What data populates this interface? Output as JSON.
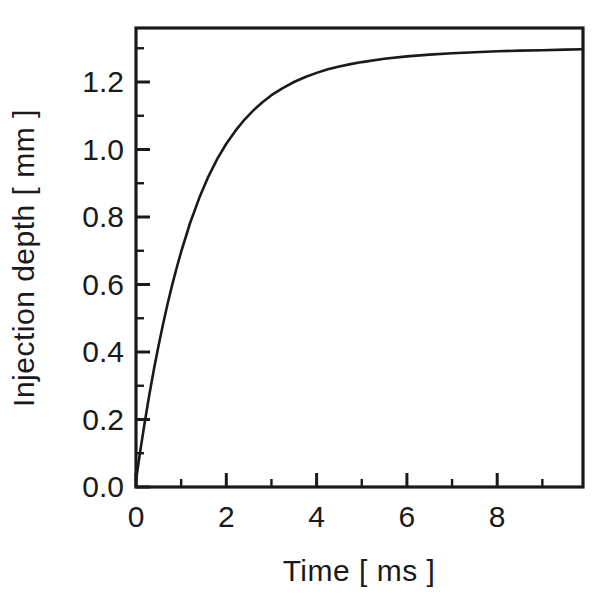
{
  "chart_data": {
    "type": "line",
    "title": "",
    "xlabel": "Time  [ ms ]",
    "ylabel": "Injection depth  [ mm ]",
    "xlim": [
      0,
      9.9
    ],
    "ylim": [
      0.0,
      1.36
    ],
    "grid": false,
    "legend": null,
    "x_ticks_major": [
      0,
      2,
      4,
      6,
      8
    ],
    "x_tick_labels": [
      "0",
      "2",
      "4",
      "6",
      "8"
    ],
    "x_ticks_minor": [
      1,
      3,
      5,
      7,
      9
    ],
    "y_ticks_major": [
      0.0,
      0.2,
      0.4,
      0.6,
      0.8,
      1.0,
      1.2
    ],
    "y_tick_labels": [
      "0.0",
      "0.2",
      "0.4",
      "0.6",
      "0.8",
      "1.0",
      "1.2"
    ],
    "y_ticks_minor": [
      0.1,
      0.3,
      0.5,
      0.7,
      0.9,
      1.1,
      1.3
    ],
    "series": [
      {
        "name": "Injection depth",
        "color": "#1a1a1a",
        "x": [
          0.0,
          0.1,
          0.2,
          0.3,
          0.4,
          0.5,
          0.6,
          0.7,
          0.8,
          0.9,
          1.0,
          1.2,
          1.4,
          1.6,
          1.8,
          2.0,
          2.2,
          2.4,
          2.6,
          2.8,
          3.0,
          3.25,
          3.5,
          3.75,
          4.0,
          4.25,
          4.5,
          4.75,
          5.0,
          5.5,
          6.0,
          6.5,
          7.0,
          7.5,
          8.0,
          8.5,
          9.0,
          9.5,
          9.9
        ],
        "y": [
          0.02,
          0.112,
          0.197,
          0.277,
          0.351,
          0.419,
          0.483,
          0.543,
          0.598,
          0.649,
          0.697,
          0.783,
          0.856,
          0.919,
          0.972,
          1.017,
          1.055,
          1.088,
          1.116,
          1.14,
          1.161,
          1.182,
          1.2,
          1.215,
          1.227,
          1.238,
          1.246,
          1.253,
          1.259,
          1.269,
          1.276,
          1.281,
          1.285,
          1.288,
          1.291,
          1.293,
          1.294,
          1.296,
          1.297
        ]
      }
    ],
    "model_note": "saturating exponential approaching ~1.30 mm"
  },
  "figure": {
    "background_color": "#ffffff",
    "foreground_color": "#1a1a1a"
  }
}
